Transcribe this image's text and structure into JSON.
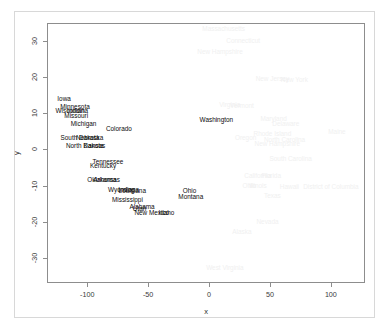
{
  "figure": {
    "width": 389,
    "height": 336,
    "background": "#ffffff",
    "panel_border_color": "#8d8d8d",
    "outer_frame_color": "#d8d8d8",
    "label_color_dark": "#0b0b0b",
    "label_color_faint": "#f0f0f0"
  },
  "chart_data": {
    "type": "scatter",
    "title": "",
    "xlabel": "x",
    "ylabel": "y",
    "xlim": [
      -133,
      128
    ],
    "ylim": [
      -37,
      35
    ],
    "xticks": [
      -100,
      -50,
      0,
      50,
      100
    ],
    "yticks": [
      30,
      20,
      10,
      0,
      -10,
      -20,
      -30
    ],
    "xtick_labels": [
      "-100",
      "-50",
      "0",
      "50",
      "100"
    ],
    "ytick_labels": [
      "30",
      "20",
      "10",
      "0",
      "-10",
      "-20",
      "-30"
    ],
    "grid": false,
    "legend": null,
    "marker": "text-label",
    "note": "Points are rendered as state-name text labels; a subset is drawn in near-white (very faint) and a subset in black.",
    "points": [
      {
        "label": "Massachusetts",
        "x": 12,
        "y": 33.5,
        "shade": "faint"
      },
      {
        "label": "Connecticut",
        "x": 28,
        "y": 30.2,
        "shade": "faint"
      },
      {
        "label": "New Hampshire",
        "x": 9,
        "y": 27.2,
        "shade": "faint"
      },
      {
        "label": "New Jersey",
        "x": 52,
        "y": 19.8,
        "shade": "faint"
      },
      {
        "label": "New York",
        "x": 70,
        "y": 19.5,
        "shade": "faint"
      },
      {
        "label": "Iowa",
        "x": -119,
        "y": 14.2,
        "shade": "dark"
      },
      {
        "label": "Vermont",
        "x": 27,
        "y": 12.2,
        "shade": "faint"
      },
      {
        "label": "Virginia",
        "x": 17,
        "y": 12.5,
        "shade": "faint"
      },
      {
        "label": "Minnesota",
        "x": -110,
        "y": 12.0,
        "shade": "dark"
      },
      {
        "label": "Wisconsin",
        "x": -114,
        "y": 10.8,
        "shade": "dark"
      },
      {
        "label": "Indiana",
        "x": -108,
        "y": 10.9,
        "shade": "dark"
      },
      {
        "label": "Missouri",
        "x": -109,
        "y": 9.6,
        "shade": "dark"
      },
      {
        "label": "Washington",
        "x": 6,
        "y": 8.3,
        "shade": "dark"
      },
      {
        "label": "Maryland",
        "x": 53,
        "y": 8.6,
        "shade": "faint"
      },
      {
        "label": "Delaware",
        "x": 63,
        "y": 7.3,
        "shade": "faint"
      },
      {
        "label": "Michigan",
        "x": -103,
        "y": 7.2,
        "shade": "dark"
      },
      {
        "label": "Colorado",
        "x": -74,
        "y": 6.0,
        "shade": "dark"
      },
      {
        "label": "Rhode Island",
        "x": 52,
        "y": 4.5,
        "shade": "faint"
      },
      {
        "label": "Maine",
        "x": 105,
        "y": 5.0,
        "shade": "faint"
      },
      {
        "label": "Oregon",
        "x": 30,
        "y": 3.5,
        "shade": "faint"
      },
      {
        "label": "South Dakota",
        "x": -106,
        "y": 3.3,
        "shade": "dark"
      },
      {
        "label": "Nebraska",
        "x": -98,
        "y": 3.4,
        "shade": "dark"
      },
      {
        "label": "North Carolina",
        "x": 62,
        "y": 3.0,
        "shade": "faint"
      },
      {
        "label": "New Hampshire",
        "x": 56,
        "y": 1.8,
        "shade": "faint"
      },
      {
        "label": "North Dakota",
        "x": -102,
        "y": 1.2,
        "shade": "dark"
      },
      {
        "label": "Kansas",
        "x": -94,
        "y": 1.2,
        "shade": "dark"
      },
      {
        "label": "South Carolina",
        "x": 67,
        "y": -2.5,
        "shade": "faint"
      },
      {
        "label": "Tennessee",
        "x": -83,
        "y": -3.3,
        "shade": "dark"
      },
      {
        "label": "Kentucky",
        "x": -87,
        "y": -4.3,
        "shade": "dark"
      },
      {
        "label": "California",
        "x": 40,
        "y": -7.0,
        "shade": "faint"
      },
      {
        "label": "Florida",
        "x": 51,
        "y": -7.0,
        "shade": "faint"
      },
      {
        "label": "Oklahoma",
        "x": -88,
        "y": -8.2,
        "shade": "dark"
      },
      {
        "label": "Arkansas",
        "x": -84,
        "y": -8.3,
        "shade": "dark"
      },
      {
        "label": "Ohio",
        "x": 33,
        "y": -9.8,
        "shade": "faint"
      },
      {
        "label": "Illinois",
        "x": 40,
        "y": -9.8,
        "shade": "faint"
      },
      {
        "label": "Hawaii",
        "x": 66,
        "y": -10.0,
        "shade": "faint"
      },
      {
        "label": "District of Columbia",
        "x": 100,
        "y": -10.0,
        "shade": "faint"
      },
      {
        "label": "Wyoming",
        "x": -72,
        "y": -11.0,
        "shade": "dark"
      },
      {
        "label": "Indiana",
        "x": -66,
        "y": -11.0,
        "shade": "dark"
      },
      {
        "label": "Louisiana",
        "x": -63,
        "y": -11.2,
        "shade": "dark"
      },
      {
        "label": "Ohio",
        "x": -16,
        "y": -11.2,
        "shade": "dark"
      },
      {
        "label": "Texas",
        "x": 52,
        "y": -12.5,
        "shade": "faint"
      },
      {
        "label": "Montana",
        "x": -15,
        "y": -13.0,
        "shade": "dark"
      },
      {
        "label": "Mississippi",
        "x": -67,
        "y": -13.6,
        "shade": "dark"
      },
      {
        "label": "Alabama",
        "x": -55,
        "y": -15.8,
        "shade": "dark"
      },
      {
        "label": "Utah",
        "x": -57,
        "y": -16.2,
        "shade": "dark"
      },
      {
        "label": "New Mexico",
        "x": -47,
        "y": -17.3,
        "shade": "dark"
      },
      {
        "label": "Idaho",
        "x": -35,
        "y": -17.3,
        "shade": "dark"
      },
      {
        "label": "Nevada",
        "x": 48,
        "y": -19.8,
        "shade": "faint"
      },
      {
        "label": "Alaska",
        "x": 27,
        "y": -22.6,
        "shade": "faint"
      },
      {
        "label": "West Virginia",
        "x": 13,
        "y": -32.5,
        "shade": "faint"
      }
    ]
  }
}
